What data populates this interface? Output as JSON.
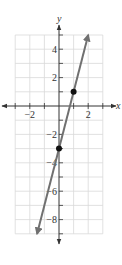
{
  "chart_data": {
    "type": "line",
    "title": "",
    "xlabel": "x",
    "ylabel": "y",
    "xlim": [
      -3,
      3
    ],
    "ylim": [
      -9,
      5
    ],
    "grid": true,
    "x_ticks": [
      -3,
      -2,
      -1,
      0,
      1,
      2,
      3
    ],
    "y_ticks": [
      5,
      4,
      3,
      2,
      1,
      0,
      -1,
      -2,
      -3,
      -4,
      -5,
      -6,
      -7,
      -8,
      -9
    ],
    "x_tick_labels": [
      {
        "value": -2,
        "label": "−2"
      },
      {
        "value": 2,
        "label": "2"
      }
    ],
    "y_tick_labels": [
      {
        "value": 4,
        "label": "4"
      },
      {
        "value": 2,
        "label": "2"
      },
      {
        "value": -2,
        "label": "−2"
      },
      {
        "value": -4,
        "label": "−4"
      },
      {
        "value": -6,
        "label": "−6"
      },
      {
        "value": -8,
        "label": "−8"
      }
    ],
    "series": [
      {
        "name": "y = 4x - 3",
        "equation": "y = 4x - 3",
        "slope": 4,
        "intercept": -3,
        "x": [
          -1.5,
          2
        ],
        "y": [
          -9,
          5
        ],
        "arrows": "both",
        "color": "#707070"
      }
    ],
    "points": [
      {
        "x": 0,
        "y": -3
      },
      {
        "x": 1,
        "y": 1
      }
    ]
  }
}
